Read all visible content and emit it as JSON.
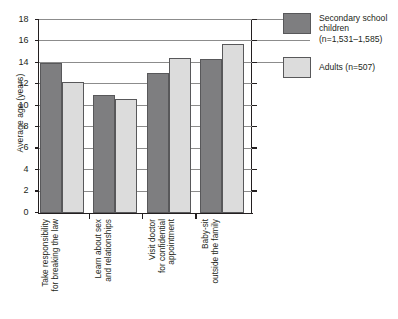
{
  "chart_data": {
    "type": "bar",
    "title": "",
    "xlabel": "",
    "ylabel": "Average age (years)",
    "ylim": [
      0,
      18
    ],
    "ytick_step": 2,
    "yticks": [
      0,
      2,
      4,
      6,
      8,
      10,
      12,
      14,
      16,
      18
    ],
    "ytick_labels": [
      "0",
      "2",
      "4",
      "6",
      "8",
      "10",
      "12",
      "14",
      "16",
      "18"
    ],
    "grid": true,
    "grid_axis": "y",
    "legend_position": "right",
    "categories": [
      "Take responsibility for breaking the law",
      "Learn about sex and relationships",
      "Visit doctor for confidential appointment",
      "Baby-sit outside the family"
    ],
    "category_lines": [
      [
        "Take responsibility",
        "for breaking the law"
      ],
      [
        "Learn about sex",
        "and relationships"
      ],
      [
        "Visit doctor",
        "for confidential",
        "appointment"
      ],
      [
        "Baby-sit",
        "outside the family"
      ]
    ],
    "series": [
      {
        "name": "Secondary school children (n=1,531–1,585)",
        "color": "#7e7e80",
        "values": [
          14.0,
          11.0,
          13.1,
          14.4
        ]
      },
      {
        "name": "Adults (n=507)",
        "color": "#dcdcdc",
        "values": [
          12.2,
          10.6,
          14.5,
          15.8
        ]
      }
    ]
  },
  "legend": {
    "items": [
      {
        "swatch": "series-0-swatch",
        "lines": [
          "Secondary school",
          "children",
          "(n=1,531–1,585)"
        ]
      },
      {
        "swatch": "series-1-swatch",
        "lines": [
          "Adults (n=507)"
        ]
      }
    ]
  },
  "top_strip": {
    "text": ""
  }
}
